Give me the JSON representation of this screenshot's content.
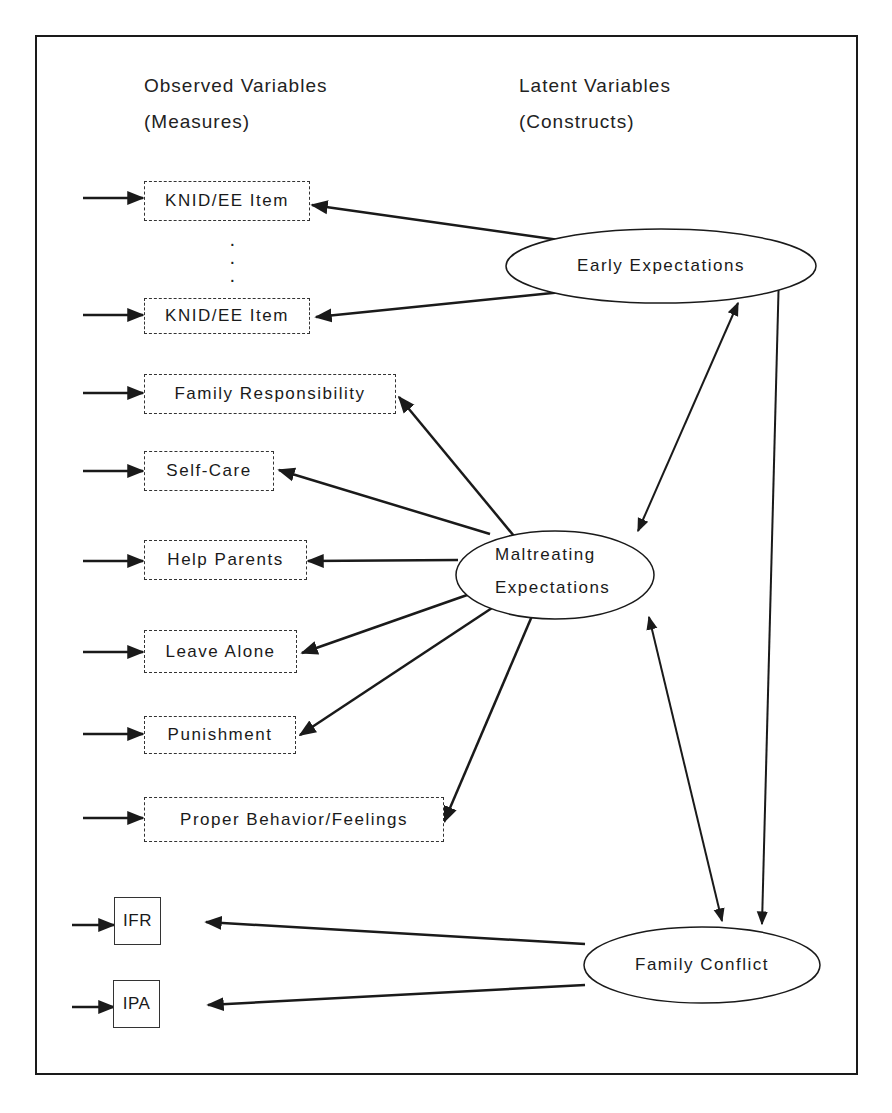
{
  "headers": {
    "observed_title": "Observed Variables",
    "observed_sub": "(Measures)",
    "latent_title": "Latent Variables",
    "latent_sub": "(Constructs)"
  },
  "observed": [
    {
      "id": "knid1",
      "label": "KNID/EE Item"
    },
    {
      "id": "knid2",
      "label": "KNID/EE Item"
    },
    {
      "id": "famresp",
      "label": "Family Responsibility"
    },
    {
      "id": "selfcare",
      "label": "Self-Care"
    },
    {
      "id": "helpparents",
      "label": "Help Parents"
    },
    {
      "id": "leavealone",
      "label": "Leave Alone"
    },
    {
      "id": "punishment",
      "label": "Punishment"
    },
    {
      "id": "properbeh",
      "label": "Proper Behavior/Feelings"
    },
    {
      "id": "ifr",
      "label": "IFR"
    },
    {
      "id": "ipa",
      "label": "IPA"
    }
  ],
  "ellipsis_dots": "·\n·\n·",
  "latent": [
    {
      "id": "early",
      "label": "Early Expectations"
    },
    {
      "id": "maltreat",
      "label_line1": "Maltreating",
      "label_line2": "Expectations"
    },
    {
      "id": "conflict",
      "label": "Family Conflict"
    }
  ],
  "edges": [
    {
      "from": "early",
      "to": "knid1",
      "type": "directed"
    },
    {
      "from": "early",
      "to": "knid2",
      "type": "directed"
    },
    {
      "from": "maltreat",
      "to": "famresp",
      "type": "directed"
    },
    {
      "from": "maltreat",
      "to": "selfcare",
      "type": "directed"
    },
    {
      "from": "maltreat",
      "to": "helpparents",
      "type": "directed"
    },
    {
      "from": "maltreat",
      "to": "leavealone",
      "type": "directed"
    },
    {
      "from": "maltreat",
      "to": "punishment",
      "type": "directed"
    },
    {
      "from": "maltreat",
      "to": "properbeh",
      "type": "directed"
    },
    {
      "from": "conflict",
      "to": "ifr",
      "type": "directed"
    },
    {
      "from": "conflict",
      "to": "ipa",
      "type": "directed"
    },
    {
      "from": "early",
      "to": "maltreat",
      "type": "bidirectional"
    },
    {
      "from": "maltreat",
      "to": "conflict",
      "type": "bidirectional"
    },
    {
      "from": "early",
      "to": "conflict",
      "type": "bidirectional"
    }
  ]
}
